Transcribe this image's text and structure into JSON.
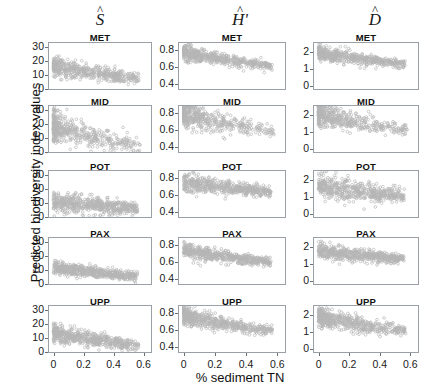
{
  "figure": {
    "xlabel": "% sediment TN",
    "ylabel": "Predicted biodiversity index values"
  },
  "columns": [
    {
      "key": "S",
      "symbol": "S",
      "hat": "^",
      "prime": "",
      "ylim": [
        0,
        33
      ],
      "yticks": [
        0,
        10,
        20,
        30
      ],
      "yticklabels": [
        "0",
        "10",
        "20",
        "30"
      ]
    },
    {
      "key": "H",
      "symbol": "H",
      "hat": "^",
      "prime": "'",
      "ylim": [
        0.34,
        0.88
      ],
      "yticks": [
        0.4,
        0.6,
        0.8
      ],
      "yticklabels": [
        "0.4",
        "0.6",
        "0.8"
      ]
    },
    {
      "key": "D",
      "symbol": "D",
      "hat": "^",
      "prime": "",
      "ylim": [
        -0.2,
        2.5
      ],
      "yticks": [
        0,
        1,
        2
      ],
      "yticklabels": [
        "0",
        "1",
        "2"
      ]
    }
  ],
  "rows": [
    {
      "key": "MET",
      "label": "MET"
    },
    {
      "key": "MID",
      "label": "MID"
    },
    {
      "key": "POT",
      "label": "POT"
    },
    {
      "key": "PAX",
      "label": "PAX"
    },
    {
      "key": "UPP",
      "label": "UPP"
    }
  ],
  "xaxis": {
    "xlim": [
      -0.03,
      0.65
    ],
    "ticks": [
      0,
      0.2,
      0.4,
      0.6
    ],
    "ticklabels": [
      "0",
      "0.2",
      "0.4",
      "0.6"
    ]
  },
  "style": {
    "point_color": "#7a7a7a",
    "point_radius": 1.35,
    "point_opacity": 0.55,
    "axis_color": "#9aa0a6"
  },
  "chart_data": {
    "type": "scatter",
    "title": "",
    "xlabel": "% sediment TN",
    "ylabel": "Predicted biodiversity index values",
    "grid": false,
    "legend": null,
    "layout": {
      "rows": 5,
      "cols": 3,
      "row_labels": [
        "MET",
        "MID",
        "POT",
        "PAX",
        "UPP"
      ],
      "col_labels": [
        "S-hat",
        "H-hat-prime",
        "D-hat"
      ]
    },
    "xlim": [
      -0.03,
      0.65
    ],
    "xticks": [
      0,
      0.2,
      0.4,
      0.6
    ],
    "panels": [
      {
        "col": "S",
        "row": "MET",
        "ylim": [
          0,
          33
        ],
        "yticks": [
          0,
          10,
          20,
          30
        ],
        "n": 520,
        "trend": {
          "y_at_x0": 16.5,
          "y_at_x05": 8.5,
          "spread": 2.6,
          "x_density": "dense-low"
        }
      },
      {
        "col": "S",
        "row": "MID",
        "ylim": [
          0,
          33
        ],
        "yticks": [
          0,
          10,
          20,
          30
        ],
        "n": 480,
        "trend": {
          "y_at_x0": 19.0,
          "y_at_x05": 6.0,
          "spread": 4.2,
          "x_density": "very-dense-low"
        }
      },
      {
        "col": "S",
        "row": "POT",
        "ylim": [
          0,
          33
        ],
        "yticks": [
          0,
          10,
          20,
          30
        ],
        "n": 540,
        "trend": {
          "y_at_x0": 11.0,
          "y_at_x05": 6.5,
          "spread": 3.0,
          "x_density": "spread"
        }
      },
      {
        "col": "S",
        "row": "PAX",
        "ylim": [
          0,
          33
        ],
        "yticks": [
          0,
          10,
          20,
          30
        ],
        "n": 560,
        "trend": {
          "y_at_x0": 12.0,
          "y_at_x05": 6.0,
          "spread": 2.0,
          "x_density": "spread"
        }
      },
      {
        "col": "S",
        "row": "UPP",
        "ylim": [
          0,
          33
        ],
        "yticks": [
          0,
          10,
          20,
          30
        ],
        "n": 560,
        "trend": {
          "y_at_x0": 14.5,
          "y_at_x05": 5.0,
          "spread": 2.6,
          "x_density": "dense-low"
        }
      },
      {
        "col": "H",
        "row": "MET",
        "ylim": [
          0.34,
          0.88
        ],
        "yticks": [
          0.4,
          0.6,
          0.8
        ],
        "n": 520,
        "trend": {
          "y_at_x0": 0.775,
          "y_at_x05": 0.625,
          "spread": 0.035,
          "x_density": "dense-low"
        }
      },
      {
        "col": "H",
        "row": "MID",
        "ylim": [
          0.34,
          0.88
        ],
        "yticks": [
          0.4,
          0.6,
          0.8
        ],
        "n": 480,
        "trend": {
          "y_at_x0": 0.795,
          "y_at_x05": 0.595,
          "spread": 0.055,
          "x_density": "very-dense-low"
        }
      },
      {
        "col": "H",
        "row": "POT",
        "ylim": [
          0.34,
          0.88
        ],
        "yticks": [
          0.4,
          0.6,
          0.8
        ],
        "n": 540,
        "trend": {
          "y_at_x0": 0.755,
          "y_at_x05": 0.645,
          "spread": 0.042,
          "x_density": "spread"
        }
      },
      {
        "col": "H",
        "row": "PAX",
        "ylim": [
          0.34,
          0.88
        ],
        "yticks": [
          0.4,
          0.6,
          0.8
        ],
        "n": 560,
        "trend": {
          "y_at_x0": 0.745,
          "y_at_x05": 0.605,
          "spread": 0.035,
          "x_density": "spread"
        }
      },
      {
        "col": "H",
        "row": "UPP",
        "ylim": [
          0.34,
          0.88
        ],
        "yticks": [
          0.4,
          0.6,
          0.8
        ],
        "n": 560,
        "trend": {
          "y_at_x0": 0.775,
          "y_at_x05": 0.605,
          "spread": 0.04,
          "x_density": "dense-low"
        }
      },
      {
        "col": "D",
        "row": "MET",
        "ylim": [
          -0.2,
          2.5
        ],
        "yticks": [
          0,
          1,
          2
        ],
        "n": 520,
        "trend": {
          "y_at_x0": 1.95,
          "y_at_x05": 1.35,
          "spread": 0.17,
          "x_density": "dense-low"
        }
      },
      {
        "col": "D",
        "row": "MID",
        "ylim": [
          -0.2,
          2.5
        ],
        "yticks": [
          0,
          1,
          2
        ],
        "n": 480,
        "trend": {
          "y_at_x0": 2.05,
          "y_at_x05": 1.2,
          "spread": 0.26,
          "x_density": "very-dense-low"
        }
      },
      {
        "col": "D",
        "row": "POT",
        "ylim": [
          -0.2,
          2.5
        ],
        "yticks": [
          0,
          1,
          2
        ],
        "n": 540,
        "trend": {
          "y_at_x0": 1.7,
          "y_at_x05": 1.05,
          "spread": 0.3,
          "x_density": "spread"
        }
      },
      {
        "col": "D",
        "row": "PAX",
        "ylim": [
          -0.2,
          2.5
        ],
        "yticks": [
          0,
          1,
          2
        ],
        "n": 560,
        "trend": {
          "y_at_x0": 1.8,
          "y_at_x05": 1.3,
          "spread": 0.18,
          "x_density": "spread"
        }
      },
      {
        "col": "D",
        "row": "UPP",
        "ylim": [
          -0.2,
          2.5
        ],
        "yticks": [
          0,
          1,
          2
        ],
        "n": 560,
        "trend": {
          "y_at_x0": 1.88,
          "y_at_x05": 1.1,
          "spread": 0.22,
          "x_density": "dense-low"
        }
      }
    ]
  }
}
